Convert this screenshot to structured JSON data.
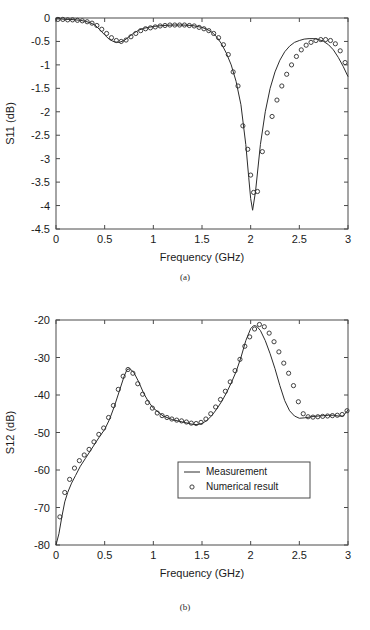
{
  "figure": {
    "caption_a": "(a)",
    "caption_b": "(b)"
  },
  "chart_data": [
    {
      "type": "line",
      "id": "s11",
      "title": "",
      "xlabel": "Frequency (GHz)",
      "ylabel": "S11 (dB)",
      "xlim": [
        0,
        3
      ],
      "ylim": [
        -4.5,
        0
      ],
      "xticks": [
        0,
        0.5,
        1,
        1.5,
        2,
        2.5,
        3
      ],
      "xtick_labels": [
        "0",
        "0.5",
        "1",
        "1.5",
        "2",
        "2.5",
        "3"
      ],
      "yticks": [
        0,
        -0.5,
        -1,
        -1.5,
        -2,
        -2.5,
        -3,
        -3.5,
        -4,
        -4.5
      ],
      "ytick_labels": [
        "0",
        "-0.5",
        "-1",
        "-1.5",
        "-2",
        "-2.5",
        "-3",
        "-3.5",
        "-4",
        "-4.5"
      ],
      "grid": false,
      "legend": null,
      "series": [
        {
          "name": "Measurement",
          "style": "line",
          "x": [
            0.0,
            0.05,
            0.1,
            0.15,
            0.2,
            0.25,
            0.3,
            0.35,
            0.4,
            0.45,
            0.5,
            0.55,
            0.6,
            0.65,
            0.7,
            0.75,
            0.8,
            0.85,
            0.9,
            0.95,
            1.0,
            1.1,
            1.2,
            1.3,
            1.4,
            1.5,
            1.55,
            1.6,
            1.65,
            1.7,
            1.75,
            1.8,
            1.85,
            1.9,
            1.95,
            1.98,
            2.0,
            2.02,
            2.05,
            2.1,
            2.15,
            2.2,
            2.25,
            2.3,
            2.35,
            2.4,
            2.45,
            2.5,
            2.55,
            2.6,
            2.65,
            2.7,
            2.75,
            2.8,
            2.85,
            2.9,
            2.95,
            3.0
          ],
          "y": [
            -0.02,
            -0.02,
            -0.03,
            -0.03,
            -0.04,
            -0.05,
            -0.07,
            -0.1,
            -0.15,
            -0.25,
            -0.36,
            -0.46,
            -0.51,
            -0.52,
            -0.48,
            -0.4,
            -0.32,
            -0.26,
            -0.22,
            -0.2,
            -0.18,
            -0.16,
            -0.15,
            -0.15,
            -0.16,
            -0.2,
            -0.24,
            -0.3,
            -0.4,
            -0.55,
            -0.75,
            -1.0,
            -1.35,
            -1.85,
            -2.7,
            -3.4,
            -3.85,
            -4.1,
            -3.7,
            -2.7,
            -2.0,
            -1.5,
            -1.15,
            -0.9,
            -0.72,
            -0.6,
            -0.52,
            -0.48,
            -0.45,
            -0.44,
            -0.44,
            -0.46,
            -0.5,
            -0.57,
            -0.68,
            -0.84,
            -1.03,
            -1.25
          ]
        },
        {
          "name": "Numerical result",
          "style": "markers",
          "x": [
            0.02,
            0.07,
            0.12,
            0.17,
            0.22,
            0.27,
            0.32,
            0.37,
            0.42,
            0.47,
            0.52,
            0.57,
            0.62,
            0.67,
            0.72,
            0.77,
            0.82,
            0.87,
            0.92,
            0.97,
            1.02,
            1.07,
            1.12,
            1.17,
            1.22,
            1.27,
            1.32,
            1.37,
            1.42,
            1.47,
            1.52,
            1.57,
            1.62,
            1.67,
            1.72,
            1.77,
            1.82,
            1.87,
            1.92,
            1.97,
            2.0,
            2.03,
            2.07,
            2.12,
            2.17,
            2.22,
            2.27,
            2.32,
            2.37,
            2.42,
            2.47,
            2.52,
            2.57,
            2.62,
            2.67,
            2.72,
            2.77,
            2.82,
            2.87,
            2.92,
            2.97
          ],
          "y": [
            -0.03,
            -0.03,
            -0.04,
            -0.04,
            -0.05,
            -0.06,
            -0.08,
            -0.11,
            -0.16,
            -0.24,
            -0.33,
            -0.42,
            -0.48,
            -0.5,
            -0.47,
            -0.4,
            -0.33,
            -0.27,
            -0.23,
            -0.21,
            -0.19,
            -0.17,
            -0.16,
            -0.15,
            -0.15,
            -0.15,
            -0.15,
            -0.16,
            -0.17,
            -0.2,
            -0.23,
            -0.27,
            -0.33,
            -0.42,
            -0.57,
            -0.78,
            -1.15,
            -1.45,
            -2.3,
            -2.8,
            -3.35,
            -3.72,
            -3.7,
            -2.85,
            -2.45,
            -2.1,
            -1.75,
            -1.45,
            -1.2,
            -1.0,
            -0.82,
            -0.68,
            -0.58,
            -0.52,
            -0.48,
            -0.46,
            -0.46,
            -0.48,
            -0.55,
            -0.7,
            -0.95
          ]
        }
      ]
    },
    {
      "type": "line",
      "id": "s12",
      "title": "",
      "xlabel": "Frequency (GHz)",
      "ylabel": "S12 (dB)",
      "xlim": [
        0,
        3
      ],
      "ylim": [
        -80,
        -20
      ],
      "xticks": [
        0,
        0.5,
        1,
        1.5,
        2,
        2.5,
        3
      ],
      "xtick_labels": [
        "0",
        "0.5",
        "1",
        "1.5",
        "2",
        "2.5",
        "3"
      ],
      "yticks": [
        -20,
        -30,
        -40,
        -50,
        -60,
        -70,
        -80
      ],
      "ytick_labels": [
        "-20",
        "-30",
        "-40",
        "-50",
        "-60",
        "-70",
        "-80"
      ],
      "grid": false,
      "legend": {
        "position": "center-right",
        "entries": [
          {
            "label": "Measurement",
            "marker": "line"
          },
          {
            "label": "Numerical result",
            "marker": "circle"
          }
        ]
      },
      "series": [
        {
          "name": "Measurement",
          "style": "line",
          "x": [
            0.0,
            0.03,
            0.06,
            0.09,
            0.12,
            0.16,
            0.2,
            0.25,
            0.3,
            0.35,
            0.4,
            0.45,
            0.5,
            0.55,
            0.6,
            0.65,
            0.7,
            0.73,
            0.76,
            0.8,
            0.85,
            0.9,
            0.95,
            1.0,
            1.1,
            1.2,
            1.3,
            1.4,
            1.45,
            1.5,
            1.55,
            1.6,
            1.65,
            1.7,
            1.75,
            1.8,
            1.85,
            1.9,
            1.95,
            2.0,
            2.03,
            2.06,
            2.1,
            2.15,
            2.2,
            2.25,
            2.3,
            2.35,
            2.4,
            2.45,
            2.5,
            2.55,
            2.6,
            2.65,
            2.7,
            2.75,
            2.8,
            2.85,
            2.9,
            2.95,
            3.0
          ],
          "y": [
            -80.0,
            -77.0,
            -72.5,
            -68.5,
            -66.0,
            -63.5,
            -61.5,
            -59.0,
            -57.0,
            -55.0,
            -53.0,
            -51.0,
            -49.2,
            -46.5,
            -43.0,
            -39.0,
            -35.0,
            -33.2,
            -33.0,
            -34.0,
            -36.5,
            -39.5,
            -41.8,
            -43.5,
            -45.6,
            -46.6,
            -47.2,
            -47.8,
            -47.9,
            -47.6,
            -46.8,
            -45.5,
            -43.8,
            -41.8,
            -39.5,
            -36.8,
            -33.8,
            -30.0,
            -25.5,
            -22.3,
            -21.5,
            -21.6,
            -22.8,
            -25.5,
            -29.0,
            -33.0,
            -37.5,
            -41.5,
            -44.2,
            -45.6,
            -46.2,
            -46.1,
            -45.9,
            -45.7,
            -45.6,
            -45.5,
            -45.4,
            -45.4,
            -45.6,
            -45.6,
            -44.0
          ]
        },
        {
          "name": "Numerical result",
          "style": "markers",
          "x": [
            0.04,
            0.09,
            0.14,
            0.19,
            0.24,
            0.29,
            0.34,
            0.39,
            0.44,
            0.49,
            0.54,
            0.59,
            0.64,
            0.69,
            0.74,
            0.79,
            0.84,
            0.89,
            0.94,
            0.99,
            1.04,
            1.09,
            1.14,
            1.19,
            1.24,
            1.29,
            1.34,
            1.39,
            1.44,
            1.49,
            1.54,
            1.59,
            1.64,
            1.69,
            1.74,
            1.79,
            1.84,
            1.89,
            1.94,
            1.99,
            2.04,
            2.09,
            2.14,
            2.19,
            2.24,
            2.29,
            2.34,
            2.39,
            2.44,
            2.49,
            2.54,
            2.59,
            2.64,
            2.69,
            2.74,
            2.79,
            2.84,
            2.89,
            2.94,
            2.99
          ],
          "y": [
            -72.5,
            -66.0,
            -62.5,
            -59.5,
            -57.5,
            -56.0,
            -54.5,
            -52.5,
            -50.5,
            -48.8,
            -46.0,
            -42.8,
            -38.5,
            -35.0,
            -33.2,
            -34.2,
            -37.0,
            -39.8,
            -42.0,
            -43.5,
            -44.8,
            -45.5,
            -46.0,
            -46.4,
            -46.7,
            -46.9,
            -47.2,
            -47.5,
            -47.6,
            -47.3,
            -46.4,
            -45.0,
            -43.2,
            -41.2,
            -39.0,
            -36.5,
            -33.5,
            -30.5,
            -27.0,
            -24.5,
            -22.4,
            -21.2,
            -21.8,
            -23.5,
            -25.8,
            -28.5,
            -31.5,
            -34.2,
            -37.5,
            -41.8,
            -45.0,
            -45.8,
            -45.9,
            -45.8,
            -45.7,
            -45.6,
            -45.5,
            -45.4,
            -45.2,
            -44.2
          ]
        }
      ]
    }
  ]
}
